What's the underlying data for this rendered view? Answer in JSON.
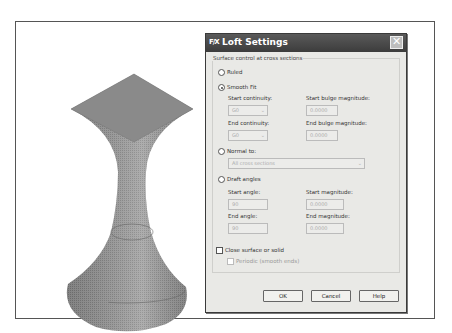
{
  "dialog": {
    "title": "Loft Settings",
    "title_icon": "F/X",
    "close_icon": "✕",
    "group_label": "Surface control at cross sections",
    "ruled": {
      "label": "Ruled",
      "selected": false
    },
    "smooth_fit": {
      "label": "Smooth Fit",
      "selected": true,
      "start_continuity_label": "Start continuity:",
      "start_continuity_value": "G0",
      "end_continuity_label": "End continuity:",
      "end_continuity_value": "G0",
      "start_bulge_label": "Start bulge magnitude:",
      "start_bulge_value": "0.0000",
      "end_bulge_label": "End bulge magnitude:",
      "end_bulge_value": "0.0000"
    },
    "normal_to": {
      "label": "Normal to:",
      "selected": false,
      "value": "All cross sections"
    },
    "draft_angles": {
      "label": "Draft angles",
      "selected": false,
      "start_angle_label": "Start angle:",
      "start_angle_value": "90",
      "end_angle_label": "End angle:",
      "end_angle_value": "90",
      "start_magnitude_label": "Start magnitude:",
      "start_magnitude_value": "0.0000",
      "end_magnitude_label": "End magnitude:",
      "end_magnitude_value": "0.0000"
    },
    "close_surface": {
      "label": "Close surface or solid",
      "checked": false
    },
    "periodic": {
      "label": "Periodic (smooth ends)",
      "checked": false
    },
    "buttons": {
      "ok": "OK",
      "cancel": "Cancel",
      "help": "Help"
    }
  },
  "viewport": {
    "object": "lofted-solid"
  }
}
